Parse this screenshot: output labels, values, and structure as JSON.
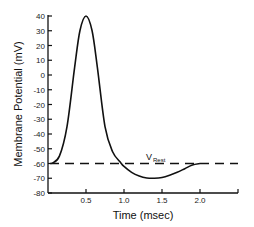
{
  "chart_data": {
    "type": "line",
    "title": "",
    "xlabel": "Time (msec)",
    "ylabel": "Membrane Potential (mV)",
    "xlim": [
      0,
      2.5
    ],
    "ylim": [
      -80,
      40
    ],
    "xticks": [
      0.5,
      1.0,
      1.5,
      2.0
    ],
    "xtick_labels": [
      "0.5",
      "1.0",
      "1.5",
      "2.0"
    ],
    "yticks": [
      40,
      30,
      20,
      10,
      0,
      -10,
      -20,
      -30,
      -40,
      -50,
      -60,
      -70,
      -80
    ],
    "ytick_labels": [
      "40",
      "30",
      "20",
      "10",
      "0",
      "-10",
      "-20",
      "-30",
      "-40",
      "-50",
      "-60",
      "-70",
      "-80"
    ],
    "grid": false,
    "legend": null,
    "series": [
      {
        "name": "Action potential",
        "x": [
          0.05,
          0.15,
          0.25,
          0.35,
          0.42,
          0.5,
          0.58,
          0.65,
          0.75,
          0.85,
          0.95,
          1.0,
          1.1,
          1.2,
          1.3,
          1.4,
          1.5,
          1.6,
          1.7,
          1.8,
          1.9,
          2.0
        ],
        "values": [
          -60,
          -55,
          -35,
          5,
          30,
          40,
          30,
          5,
          -35,
          -52,
          -59,
          -62,
          -66,
          -68.5,
          -69.8,
          -70,
          -69.5,
          -68,
          -66,
          -63.5,
          -61,
          -60
        ]
      },
      {
        "name": "V_Rest",
        "x": [
          0.0,
          2.5
        ],
        "values": [
          -60,
          -60
        ],
        "style": "dashed"
      }
    ],
    "annotations": [
      {
        "text": "V",
        "subscript": "Rest",
        "x": 1.3,
        "y": -57
      }
    ]
  },
  "labels": {
    "xlabel": "Time (msec)",
    "ylabel": "Membrane Potential (mV)",
    "vrest_main": "V",
    "vrest_sub": "Rest"
  },
  "colors": {
    "line": "#111111",
    "axis": "#111111",
    "background": "#ffffff"
  }
}
